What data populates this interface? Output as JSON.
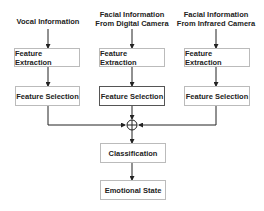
{
  "diagram": {
    "inputs": [
      {
        "line1": "Vocal Information",
        "line2": ""
      },
      {
        "line1": "Facial Information",
        "line2": "From Digital Camera"
      },
      {
        "line1": "Facial Information",
        "line2": "From Infrared Camera"
      }
    ],
    "feature_extraction": "Feature Extraction",
    "feature_selection": "Feature Selection",
    "classification": "Classification",
    "output": "Emotional State",
    "colors": {
      "line": "#222222",
      "box_border": "#bbbbbb"
    }
  }
}
